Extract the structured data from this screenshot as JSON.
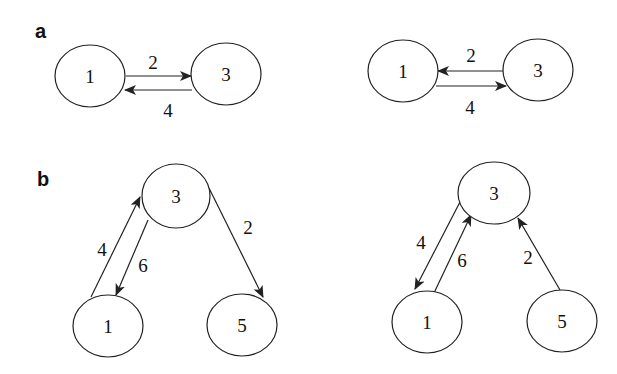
{
  "panels": {
    "a": {
      "label": "a",
      "left": {
        "nodes": {
          "n1": "1",
          "n3": "3"
        },
        "edges": [
          {
            "from": "1",
            "to": "3",
            "label": "2"
          },
          {
            "from": "3",
            "to": "1",
            "label": "4"
          }
        ]
      },
      "right": {
        "nodes": {
          "n1": "1",
          "n3": "3"
        },
        "edges": [
          {
            "from": "3",
            "to": "1",
            "label": "2"
          },
          {
            "from": "1",
            "to": "3",
            "label": "4"
          }
        ]
      }
    },
    "b": {
      "label": "b",
      "left": {
        "nodes": {
          "n1": "1",
          "n3": "3",
          "n5": "5"
        },
        "edges": [
          {
            "from": "1",
            "to": "3",
            "label": "4"
          },
          {
            "from": "3",
            "to": "1",
            "label": "6"
          },
          {
            "from": "3",
            "to": "5",
            "label": "2"
          }
        ]
      },
      "right": {
        "nodes": {
          "n1": "1",
          "n3": "3",
          "n5": "5"
        },
        "edges": [
          {
            "from": "3",
            "to": "1",
            "label": "4"
          },
          {
            "from": "1",
            "to": "3",
            "label": "6"
          },
          {
            "from": "5",
            "to": "3",
            "label": "2"
          }
        ]
      }
    }
  }
}
